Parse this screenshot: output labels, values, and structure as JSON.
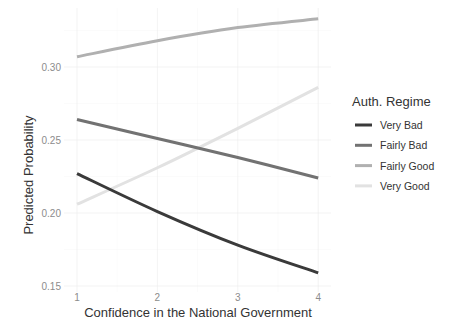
{
  "chart_data": {
    "type": "line",
    "title": "",
    "xlabel": "Confidence in the National Government",
    "ylabel": "Predicted Probability",
    "x": [
      1,
      2,
      3,
      4
    ],
    "x_ticks": [
      "1",
      "2",
      "3",
      "4"
    ],
    "y_ticks": [
      "0.15",
      "0.20",
      "0.25",
      "0.30"
    ],
    "xlim": [
      1,
      4
    ],
    "ylim": [
      0.15,
      0.335
    ],
    "grid": true,
    "legend_position": "right",
    "legend_title": "Auth. Regime",
    "series": [
      {
        "name": "Very Bad",
        "color": "#3a3a3a",
        "values": [
          0.227,
          0.201,
          0.178,
          0.159
        ]
      },
      {
        "name": "Fairly Bad",
        "color": "#727272",
        "values": [
          0.264,
          0.251,
          0.238,
          0.224
        ]
      },
      {
        "name": "Fairly Good",
        "color": "#b0b0b0",
        "values": [
          0.307,
          0.318,
          0.327,
          0.333
        ]
      },
      {
        "name": "Very Good",
        "color": "#e2e2e2",
        "values": [
          0.206,
          0.231,
          0.258,
          0.286
        ]
      }
    ]
  }
}
